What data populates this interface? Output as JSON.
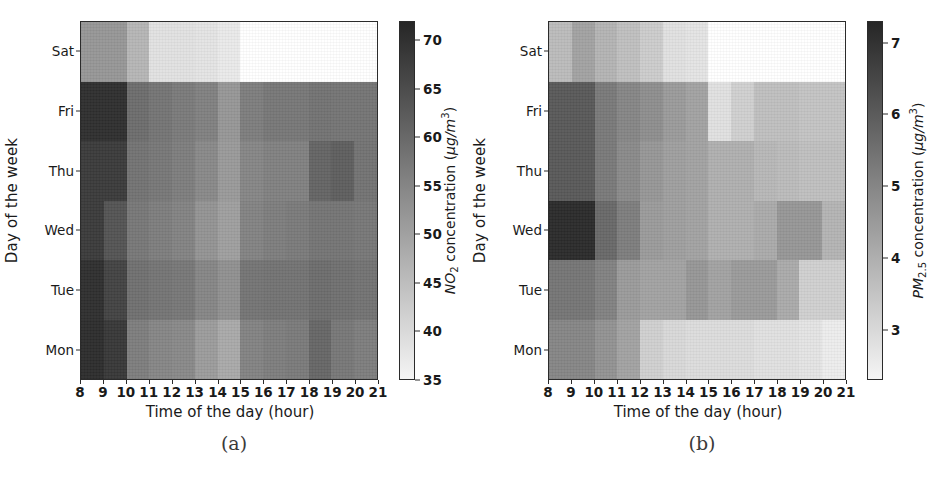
{
  "figure": {
    "width": 937,
    "height": 482,
    "background": "#ffffff"
  },
  "panels": [
    {
      "id": "a",
      "caption": "(a)",
      "xlabel": "Time of the day (hour)",
      "ylabel": "Day of the week",
      "colorbar_label_parts": {
        "pollutant": "NO",
        "subscript": "2",
        "rest": " concentration (",
        "units_num": "µg/m",
        "units_exp": "3",
        "units_close": ")"
      },
      "colorbar_label": "NO2 concentration (µg/m3)"
    },
    {
      "id": "b",
      "caption": "(b)",
      "xlabel": "Time of the day (hour)",
      "ylabel": "Day of the week",
      "colorbar_label_parts": {
        "pollutant": "PM",
        "subscript": "2.5",
        "rest": " concentration (",
        "units_num": "µg/m",
        "units_exp": "3",
        "units_close": ")"
      },
      "colorbar_label": "PM2.5 concentration (µg/m3)"
    }
  ],
  "chart_data": [
    {
      "type": "heatmap",
      "panel": "a",
      "title": "(a)",
      "xlabel": "Time of the day (hour)",
      "ylabel": "Day of the week",
      "colorbar_label": "NO2 concentration (µg/m3)",
      "x_tick_labels": [
        "8",
        "9",
        "10",
        "11",
        "12",
        "13",
        "14",
        "15",
        "16",
        "17",
        "18",
        "19",
        "20",
        "21"
      ],
      "x_categories": [
        "8",
        "9",
        "10",
        "11",
        "12",
        "13",
        "14",
        "15",
        "16",
        "17",
        "18",
        "19",
        "20"
      ],
      "y_categories": [
        "Sat",
        "Fri",
        "Thu",
        "Wed",
        "Tue",
        "Mon"
      ],
      "y_tick_labels": [
        "Sat",
        "Fri",
        "Thu",
        "Wed",
        "Tue",
        "Mon"
      ],
      "colorbar_ticks": [
        70,
        65,
        60,
        55,
        50,
        45,
        40,
        35
      ],
      "clim": [
        35,
        72
      ],
      "cmap": "gray_r",
      "grid": false,
      "legend": "colorbar-right",
      "rows": [
        {
          "day": "Sat",
          "values": [
            52.0,
            52.0,
            46.5,
            38.5,
            38.5,
            38.0,
            37.0,
            null,
            null,
            null,
            null,
            null,
            null
          ]
        },
        {
          "day": "Fri",
          "values": [
            70.5,
            70.5,
            59.5,
            58.0,
            57.0,
            56.0,
            52.0,
            56.5,
            57.5,
            57.5,
            58.5,
            58.0,
            58.0
          ]
        },
        {
          "day": "Thu",
          "values": [
            68.5,
            68.5,
            58.5,
            57.5,
            56.5,
            54.5,
            51.5,
            55.0,
            56.0,
            56.0,
            61.0,
            62.0,
            58.5
          ]
        },
        {
          "day": "Wed",
          "values": [
            68.5,
            64.0,
            57.5,
            56.5,
            55.5,
            52.5,
            50.5,
            55.5,
            56.5,
            57.0,
            58.0,
            58.0,
            57.5
          ]
        },
        {
          "day": "Tue",
          "values": [
            70.5,
            67.0,
            59.0,
            58.0,
            57.5,
            55.0,
            53.0,
            58.0,
            58.5,
            58.5,
            59.5,
            59.0,
            58.5
          ]
        },
        {
          "day": "Mon",
          "values": [
            71.0,
            69.0,
            56.5,
            55.0,
            54.5,
            51.0,
            48.5,
            55.5,
            56.5,
            57.0,
            60.5,
            57.5,
            56.5
          ]
        }
      ]
    },
    {
      "type": "heatmap",
      "panel": "b",
      "title": "(b)",
      "xlabel": "Time of the day (hour)",
      "ylabel": "Day of the week",
      "colorbar_label": "PM2.5 concentration (µg/m3)",
      "x_tick_labels": [
        "8",
        "9",
        "10",
        "11",
        "12",
        "13",
        "14",
        "15",
        "16",
        "17",
        "18",
        "19",
        "20",
        "21"
      ],
      "x_categories": [
        "8",
        "9",
        "10",
        "11",
        "12",
        "13",
        "14",
        "15",
        "16",
        "17",
        "18",
        "19",
        "20"
      ],
      "y_categories": [
        "Sat",
        "Fri",
        "Thu",
        "Wed",
        "Tue",
        "Mon"
      ],
      "y_tick_labels": [
        "Sat",
        "Fri",
        "Thu",
        "Wed",
        "Tue",
        "Mon"
      ],
      "colorbar_ticks": [
        7,
        6,
        5,
        4,
        3
      ],
      "clim": [
        2.3,
        7.3
      ],
      "cmap": "gray_r",
      "grid": false,
      "legend": "colorbar-right",
      "rows": [
        {
          "day": "Sat",
          "values": [
            3.7,
            4.3,
            3.9,
            3.6,
            3.3,
            2.8,
            2.7,
            null,
            null,
            null,
            null,
            null,
            null
          ]
        },
        {
          "day": "Fri",
          "values": [
            6.1,
            6.1,
            5.3,
            5.0,
            4.8,
            4.5,
            4.3,
            2.8,
            3.2,
            3.6,
            3.6,
            3.5,
            3.5
          ]
        },
        {
          "day": "Thu",
          "values": [
            6.1,
            6.1,
            5.3,
            4.9,
            4.6,
            4.4,
            4.3,
            4.0,
            4.0,
            3.8,
            3.7,
            3.6,
            3.6
          ]
        },
        {
          "day": "Wed",
          "values": [
            7.2,
            7.2,
            5.7,
            5.2,
            4.5,
            4.4,
            4.3,
            4.0,
            4.0,
            4.1,
            4.6,
            4.6,
            3.9
          ]
        },
        {
          "day": "Tue",
          "values": [
            5.4,
            5.4,
            5.1,
            4.5,
            4.3,
            4.3,
            4.6,
            4.3,
            4.5,
            4.5,
            4.1,
            3.2,
            3.2
          ]
        },
        {
          "day": "Mon",
          "values": [
            5.0,
            5.0,
            4.7,
            4.3,
            3.2,
            3.0,
            2.9,
            2.9,
            2.9,
            2.8,
            2.8,
            2.7,
            2.5
          ]
        }
      ]
    }
  ]
}
